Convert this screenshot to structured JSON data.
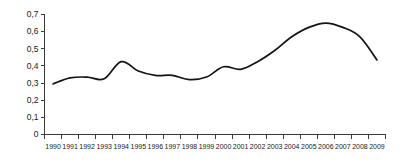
{
  "chart_data": {
    "type": "line",
    "title": "",
    "subtitle": "",
    "xlabel": "",
    "ylabel": "",
    "categories": [
      "1990",
      "1991",
      "1992",
      "1993",
      "1994",
      "1995",
      "1996",
      "1997",
      "1998",
      "1999",
      "2000",
      "2001",
      "2002",
      "2003",
      "2004",
      "2005",
      "2006",
      "2007",
      "2008",
      "2009"
    ],
    "values": [
      0.295,
      0.33,
      0.335,
      0.325,
      0.425,
      0.37,
      0.345,
      0.345,
      0.32,
      0.335,
      0.395,
      0.38,
      0.425,
      0.49,
      0.57,
      0.625,
      0.65,
      0.625,
      0.57,
      0.435
    ],
    "series": [
      {
        "name": "",
        "values": [
          0.295,
          0.33,
          0.335,
          0.325,
          0.425,
          0.37,
          0.345,
          0.345,
          0.32,
          0.335,
          0.395,
          0.38,
          0.425,
          0.49,
          0.57,
          0.625,
          0.65,
          0.625,
          0.57,
          0.435
        ]
      }
    ],
    "ylim": [
      0,
      0.7
    ],
    "ytick_values": [
      0,
      0.1,
      0.2,
      0.3,
      0.4,
      0.5,
      0.6,
      0.7
    ],
    "ytick_labels": [
      "0",
      "0,1",
      "0,2",
      "0,3",
      "0,4",
      "0,5",
      "0,6",
      "0,7"
    ],
    "xtick_labels": [
      "1990",
      "1991",
      "1992",
      "1993",
      "1994",
      "1995",
      "1996",
      "1997",
      "1998",
      "1999",
      "2000",
      "2001",
      "2002",
      "2003",
      "2004",
      "2005",
      "2006",
      "2007",
      "2008",
      "2009"
    ],
    "grid": false,
    "legend": false,
    "legend_position": "none",
    "line_color": "#141414",
    "axis_color": "#3a3a3a",
    "background_color": "#ffffff",
    "annotations": []
  }
}
